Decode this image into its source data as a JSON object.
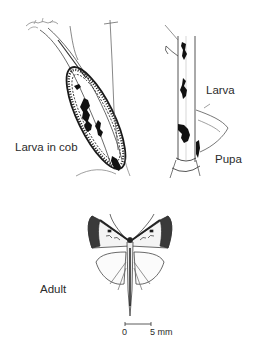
{
  "figure": {
    "labels": {
      "larva_in_cob": "Larva in cob",
      "larva": "Larva",
      "pupa": "Pupa",
      "adult": "Adult"
    },
    "scale_bar": {
      "start": "0",
      "end": "5 mm"
    },
    "colors": {
      "ink": "#1a1a1a",
      "background": "#ffffff"
    }
  }
}
